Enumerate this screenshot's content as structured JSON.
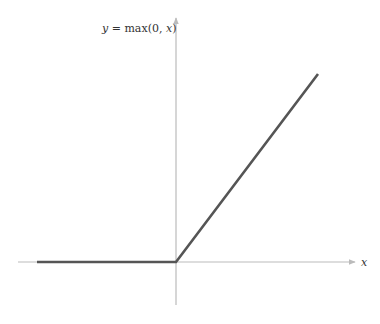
{
  "chart_data": {
    "type": "line",
    "title": "",
    "function_label": {
      "lhs": "y",
      "eq": " = ",
      "rhs_prefix": "max(0, ",
      "rhs_var": "x",
      "rhs_suffix": ")"
    },
    "xlabel": "x",
    "ylabel": "",
    "xlim": [
      -5,
      5
    ],
    "ylim": [
      -1.5,
      7
    ],
    "grid": false,
    "legend": "none",
    "series": [
      {
        "name": "ReLU",
        "x": [
          -5,
          0,
          5
        ],
        "y": [
          0,
          0,
          5
        ]
      }
    ],
    "colors": {
      "line": "#555555",
      "axes": "#bbbbbb"
    }
  }
}
